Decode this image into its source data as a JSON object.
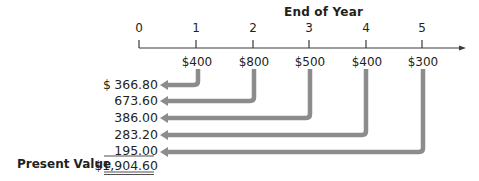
{
  "title": "End of Year",
  "years": [
    "0",
    "1",
    "2",
    "3",
    "4",
    "5"
  ],
  "cash_flows": [
    "$400",
    "$800",
    "$500",
    "$400",
    "$300"
  ],
  "present_values": {
    "currency_symbol": "$",
    "values": [
      "366.80",
      "673.60",
      "386.00",
      "283.20",
      "195.00"
    ]
  },
  "total": {
    "label": "Present Value",
    "value": "$1,904.60"
  },
  "colors": {
    "arrow": "#8c8c8c",
    "text": "#231f20",
    "axis": "#3a3a3a"
  }
}
